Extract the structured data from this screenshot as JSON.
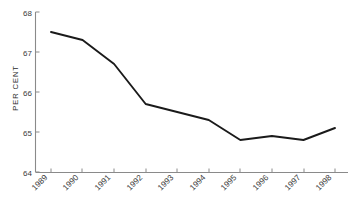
{
  "chart_data": {
    "type": "line",
    "title": "",
    "subtitle": "",
    "xlabel": "",
    "ylabel": "PER CENT",
    "categories": [
      "1989",
      "1990",
      "1991",
      "1992",
      "1993",
      "1994",
      "1995",
      "1996",
      "1997",
      "1998"
    ],
    "values": [
      67.5,
      67.3,
      66.7,
      65.7,
      65.5,
      65.3,
      64.8,
      64.9,
      64.8,
      65.1
    ],
    "series": [
      {
        "name": "",
        "values": [
          67.5,
          67.3,
          66.7,
          65.7,
          65.5,
          65.3,
          64.8,
          64.9,
          64.8,
          65.1
        ]
      }
    ],
    "ylim": [
      64,
      68
    ],
    "yticks": [
      "64",
      "65",
      "66",
      "67",
      "68"
    ],
    "ytick_values": [
      64,
      65,
      66,
      67,
      68
    ],
    "xlim": [
      "1989",
      "1998"
    ],
    "grid": false,
    "legend": null,
    "legend_position": "none",
    "annotations": [],
    "line_color": "#1a1a1a",
    "axis_color": "#8a8a8a",
    "xtick_rotation": 45
  },
  "axis": {
    "y_title": "PER CENT",
    "y_labels": [
      "68",
      "67",
      "66",
      "65",
      "64"
    ],
    "x_labels": [
      "1989",
      "1990",
      "1991",
      "1992",
      "1993",
      "1994",
      "1995",
      "1996",
      "1997",
      "1998"
    ]
  }
}
